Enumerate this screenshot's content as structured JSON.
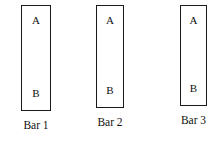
{
  "figure": {
    "title": "",
    "background_color": "#ffffff",
    "line_color": "#1a1a1a",
    "text_color": "#111111"
  },
  "bars": [
    {
      "caption": "Bar 1",
      "segment_top_label": "A",
      "segment_bottom_label": "B",
      "x": 21,
      "y": 5,
      "width": 30,
      "height": 106
    },
    {
      "caption": "Bar 2",
      "segment_top_label": "A",
      "segment_bottom_label": "B",
      "x": 96,
      "y": 5,
      "width": 28,
      "height": 103
    },
    {
      "caption": "Bar 3",
      "segment_top_label": "A",
      "segment_bottom_label": "B",
      "x": 180,
      "y": 5,
      "width": 27,
      "height": 101
    }
  ]
}
